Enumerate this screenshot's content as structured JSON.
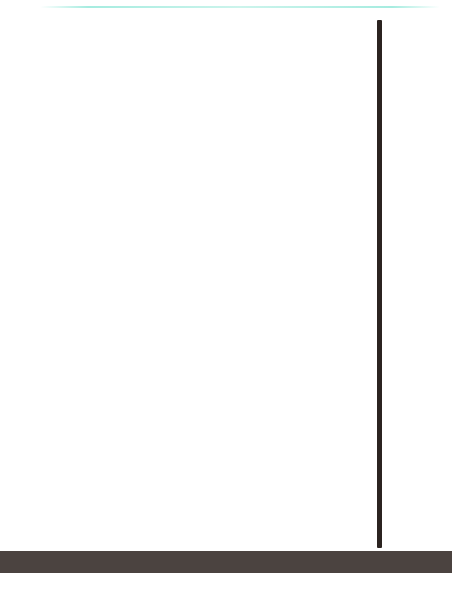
{
  "chart_data": {
    "type": "bar",
    "subtype": "stacked-bar",
    "title": "",
    "xlabel": "年度",
    "ylabel": "",
    "ylim": [
      0,
      16000
    ],
    "y_unit": "億円",
    "grid": true,
    "legend_position": "none",
    "y_ticks": [
      {
        "value": 16000,
        "label": "1兆6,000億円"
      },
      {
        "value": 14000,
        "label": "1兆4,000億円"
      },
      {
        "value": 12000,
        "label": "1兆2,000億円"
      },
      {
        "value": 10000,
        "label": "1兆円"
      },
      {
        "value": 8000,
        "label": "8,000億円"
      },
      {
        "value": 6000,
        "label": "6,000億円"
      },
      {
        "value": 4000,
        "label": "4,000億円"
      },
      {
        "value": 2000,
        "label": "2,000億円"
      },
      {
        "value": 0,
        "label": "0"
      }
    ],
    "categories": [
      "1989",
      "1990",
      "1991",
      "1992",
      "1993",
      "1994",
      "1995",
      "1996",
      "1997",
      "1998",
      "1999",
      "2000",
      "2001",
      "2002",
      "2003",
      "2004",
      "2005",
      "2006",
      "2007",
      "2008",
      "2009",
      "2010",
      "2011",
      "2012",
      "2013",
      "2014"
    ],
    "series": [
      {
        "name": "下段",
        "color": "#13171f",
        "values": [
          700,
          700,
          650,
          520,
          620,
          820,
          1300,
          1000,
          950,
          780,
          4000,
          580,
          760,
          1200,
          1050,
          1150,
          1650,
          1900,
          600,
          680,
          1850,
          1100,
          930,
          1400,
          1200,
          1250
        ]
      },
      {
        "name": "上段",
        "color": "#35b494",
        "values": [
          3750,
          4250,
          4150,
          3950,
          3900,
          4800,
          5500,
          6000,
          6200,
          6200,
          7000,
          11000,
          9500,
          10200,
          10800,
          11500,
          11500,
          10900,
          11900,
          11900,
          9700,
          10500,
          11300,
          11400,
          11400,
          13100
        ]
      }
    ],
    "x_axis_segments": [
      {
        "label": "1989〜1993",
        "style": "alt"
      },
      {
        "label": "1994〜1998",
        "style": "dark"
      },
      {
        "label": "1999〜2003",
        "style": "alt"
      },
      {
        "label": "2004〜2008",
        "style": "dark"
      },
      {
        "label": "2009〜2013",
        "style": "alt"
      },
      {
        "label": "2014",
        "style": "dark"
      }
    ],
    "annotations": [
      {
        "text": "3％の消費税を実施",
        "bar_index": 0
      },
      {
        "text": "バブル崩壊による長期不況始まる",
        "bar_index": 2
      },
      {
        "text": "ITバブルはじけ景気が後退",
        "bar_index": 11
      },
      {
        "text": "リーマンショックにより世界景気が急激に後退",
        "bar_index": 19
      },
      {
        "text": "東日本大震災が発生",
        "bar_index": 22
      }
    ],
    "milestone_badges": [
      {
        "label": "創業40年",
        "bar_index": 9
      },
      {
        "label": "創業50年",
        "bar_index": 19
      }
    ],
    "colors": {
      "bar_top": "#35b494",
      "bar_bottom": "#13171f",
      "axis": "#2b2320",
      "band_dark": "#4b4340",
      "band_light": "#9a9894",
      "badge": "#2bb592",
      "grid": "#ececec",
      "top_rule": "#a6ece0"
    }
  }
}
